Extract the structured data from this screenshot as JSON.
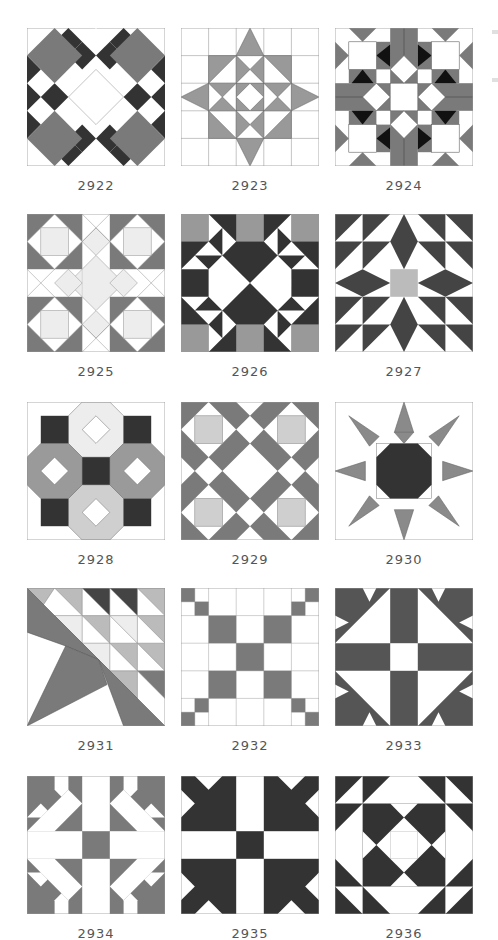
{
  "colors": {
    "white": "#ffffff",
    "light": "#d0d0d0",
    "pale": "#ededed",
    "mid": "#7a7a7a",
    "midlight": "#a9a9a9",
    "dark": "#333333",
    "black": "#111111",
    "line": "#8a8a8a"
  },
  "blocks": [
    {
      "id": "2922",
      "label": "2922"
    },
    {
      "id": "2923",
      "label": "2923"
    },
    {
      "id": "2924",
      "label": "2924"
    },
    {
      "id": "2925",
      "label": "2925"
    },
    {
      "id": "2926",
      "label": "2926"
    },
    {
      "id": "2927",
      "label": "2927"
    },
    {
      "id": "2928",
      "label": "2928"
    },
    {
      "id": "2929",
      "label": "2929"
    },
    {
      "id": "2930",
      "label": "2930"
    },
    {
      "id": "2931",
      "label": "2931"
    },
    {
      "id": "2932",
      "label": "2932"
    },
    {
      "id": "2933",
      "label": "2933"
    },
    {
      "id": "2934",
      "label": "2934"
    },
    {
      "id": "2935",
      "label": "2935"
    },
    {
      "id": "2936",
      "label": "2936"
    }
  ]
}
